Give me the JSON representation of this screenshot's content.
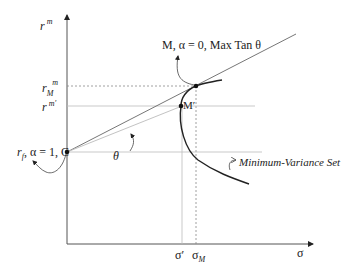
{
  "diagram": {
    "axes": {
      "y_label": "r",
      "y_label_sup": "m",
      "x_label": "σ"
    },
    "y_ticks": [
      {
        "base": "r",
        "sub": "M",
        "sup": "m",
        "name": "r_M^m"
      },
      {
        "base": "r",
        "sup": "m′",
        "name": "r^m'"
      }
    ],
    "x_ticks": [
      {
        "label": "σ′"
      },
      {
        "base": "σ",
        "sub": "M"
      }
    ],
    "points": {
      "C": {
        "label_parts": [
          "r",
          "f",
          ", α = 1, C"
        ],
        "desc": "risk-free point"
      },
      "M": {
        "label": "M, α = 0, Max Tan θ",
        "desc": "tangency portfolio"
      },
      "M_prime": {
        "label": "M′"
      }
    },
    "angle_label": "θ",
    "curve_label": "Minimum-Variance Set",
    "colors": {
      "axis": "#555555",
      "line": "#666666",
      "light_line": "#bbbbbb",
      "curve": "#222222",
      "dotted": "#888888",
      "point": "#111111",
      "text": "#222222"
    }
  }
}
